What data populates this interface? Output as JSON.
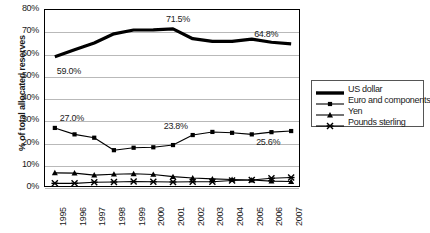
{
  "chart_data": {
    "type": "line",
    "title": "",
    "xlabel": "",
    "ylabel": "% of total allocated reserves",
    "ylim": [
      0,
      80
    ],
    "ytick_labels": [
      "80%",
      "70%",
      "60%",
      "50%",
      "40%",
      "30%",
      "20%",
      "10%",
      "0%"
    ],
    "ytick_values": [
      80,
      70,
      60,
      50,
      40,
      30,
      20,
      10,
      0
    ],
    "grid": true,
    "legend_position": "right",
    "categories": [
      "1995",
      "1996",
      "1997",
      "1998",
      "1999",
      "2000",
      "2001",
      "2002",
      "2003",
      "2004",
      "2005",
      "2006",
      "2007"
    ],
    "series": [
      {
        "name": "US dollar",
        "marker": "none",
        "values": [
          59.0,
          62.1,
          65.2,
          69.3,
          71.0,
          71.1,
          71.5,
          67.1,
          65.9,
          65.9,
          66.9,
          65.5,
          64.8
        ]
      },
      {
        "name": "Euro and components",
        "marker": "square",
        "values": [
          27.0,
          24.1,
          22.6,
          17.0,
          18.1,
          18.3,
          19.3,
          23.8,
          25.2,
          24.8,
          24.1,
          25.1,
          25.6
        ]
      },
      {
        "name": "Yen",
        "marker": "triangle",
        "values": [
          6.8,
          6.7,
          5.8,
          6.2,
          6.4,
          6.1,
          5.1,
          4.5,
          4.1,
          3.8,
          3.6,
          3.1,
          2.9
        ]
      },
      {
        "name": "Pounds sterling",
        "marker": "x",
        "values": [
          2.1,
          2.1,
          2.6,
          2.7,
          2.9,
          2.8,
          2.7,
          2.8,
          2.8,
          3.4,
          3.6,
          4.4,
          4.7
        ]
      }
    ],
    "annotations": [
      {
        "text": "59.0%",
        "series": "US dollar",
        "category": "1995"
      },
      {
        "text": "71.5%",
        "series": "US dollar",
        "category": "2001"
      },
      {
        "text": "64.8%",
        "series": "US dollar",
        "category": "2007"
      },
      {
        "text": "27.0%",
        "series": "Euro and components",
        "category": "1995"
      },
      {
        "text": "23.8%",
        "series": "Euro and components",
        "category": "2002"
      },
      {
        "text": "25.6%",
        "series": "Euro and components",
        "category": "2007"
      }
    ]
  },
  "legend": {
    "items": [
      {
        "label": "US dollar"
      },
      {
        "label": "Euro and components"
      },
      {
        "label": "Yen"
      },
      {
        "label": "Pounds sterling"
      }
    ]
  },
  "colors": {
    "series": "#000000",
    "gridline": "#b9b9b9",
    "frame": "#000000",
    "background": "#ffffff"
  }
}
